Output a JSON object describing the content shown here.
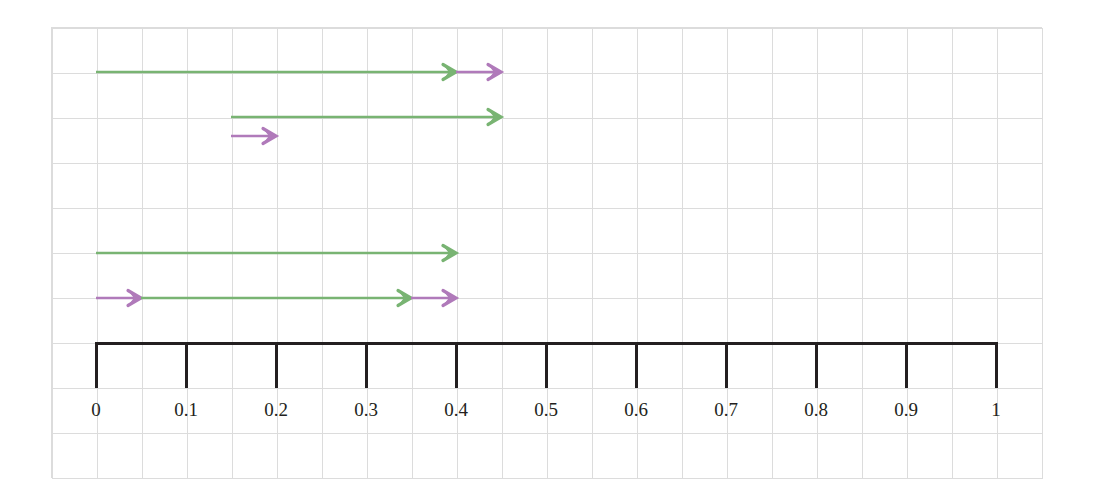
{
  "figure": {
    "title": "",
    "background_color": "#ffffff",
    "grid_color": "#dcdcdc",
    "grid_cell_px": 45,
    "axis_color": "#231f20",
    "green": "#79b473",
    "purple": "#b07aba"
  },
  "chart_data": {
    "type": "number-line",
    "title": "",
    "xlabel": "",
    "ylabel": "",
    "xlim": [
      0,
      1
    ],
    "grid": true,
    "legend": "none",
    "axis": {
      "ticks": [
        0,
        0.1,
        0.2,
        0.3,
        0.4,
        0.5,
        0.6,
        0.7,
        0.8,
        0.9,
        1
      ],
      "tick_labels": [
        "0",
        "0.1",
        "0.2",
        "0.3",
        "0.4",
        "0.5",
        "0.6",
        "0.7",
        "0.8",
        "0.9",
        "1"
      ],
      "tick_direction": "down",
      "line_y_px": 342
    },
    "jump_rows": [
      {
        "row": 1,
        "row_y_px": 72,
        "segments": [
          {
            "color": "green",
            "from": 0.0,
            "to": 0.4,
            "arrowhead": true
          },
          {
            "color": "purple",
            "from": 0.4,
            "to": 0.45,
            "arrowhead": true
          }
        ],
        "total": 0.45
      },
      {
        "row": 2,
        "row_y_px": 117,
        "segments": [
          {
            "color": "green",
            "from": 0.15,
            "to": 0.45,
            "arrowhead": true
          }
        ],
        "total": 0.45
      },
      {
        "row": 2,
        "row_y_px": 136,
        "segments": [
          {
            "color": "purple",
            "from": 0.15,
            "to": 0.2,
            "arrowhead": true
          }
        ],
        "total": 0.2
      },
      {
        "row": 3,
        "row_y_px": 253,
        "segments": [
          {
            "color": "green",
            "from": 0.0,
            "to": 0.4,
            "arrowhead": true
          }
        ],
        "total": 0.4
      },
      {
        "row": 4,
        "row_y_px": 298,
        "segments": [
          {
            "color": "purple",
            "from": 0.0,
            "to": 0.05,
            "arrowhead": true
          },
          {
            "color": "green",
            "from": 0.05,
            "to": 0.35,
            "arrowhead": true
          },
          {
            "color": "purple",
            "from": 0.35,
            "to": 0.4,
            "arrowhead": true
          }
        ],
        "total": 0.4
      }
    ]
  }
}
